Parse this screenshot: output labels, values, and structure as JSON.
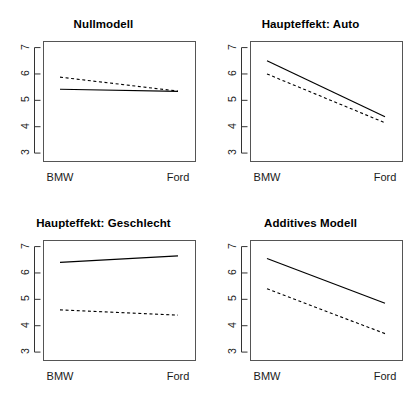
{
  "figure": {
    "type": "multi-panel-interaction-plot",
    "rows": 2,
    "cols": 2,
    "background": "#ffffff",
    "line_color": "#000000"
  },
  "chart_data": [
    {
      "type": "line",
      "title": "Nullmodell",
      "panel": "top-left",
      "categories": [
        "BMW",
        "Ford"
      ],
      "x": [
        1,
        2
      ],
      "xlabel": "",
      "ylabel": "",
      "ylim": [
        2.7,
        7.25
      ],
      "yticks": [
        3,
        4,
        5,
        6,
        7
      ],
      "ytick_labels": [
        "3",
        "4",
        "5",
        "6",
        "7"
      ],
      "grid": false,
      "legend": "none",
      "series": [
        {
          "name": "solid",
          "style": "solid",
          "values": [
            5.42,
            5.34
          ]
        },
        {
          "name": "dashed",
          "style": "dashed",
          "values": [
            5.88,
            5.35
          ]
        }
      ]
    },
    {
      "type": "line",
      "title": "Haupteffekt: Auto",
      "panel": "top-right",
      "categories": [
        "BMW",
        "Ford"
      ],
      "x": [
        1,
        2
      ],
      "xlabel": "",
      "ylabel": "",
      "ylim": [
        2.7,
        7.25
      ],
      "yticks": [
        3,
        4,
        5,
        6,
        7
      ],
      "ytick_labels": [
        "3",
        "4",
        "5",
        "6",
        "7"
      ],
      "grid": false,
      "legend": "none",
      "series": [
        {
          "name": "solid",
          "style": "solid",
          "values": [
            6.5,
            4.38
          ]
        },
        {
          "name": "dashed",
          "style": "dashed",
          "values": [
            6.0,
            4.15
          ]
        }
      ]
    },
    {
      "type": "line",
      "title": "Haupteffekt: Geschlecht",
      "panel": "bottom-left",
      "categories": [
        "BMW",
        "Ford"
      ],
      "x": [
        1,
        2
      ],
      "xlabel": "",
      "ylabel": "",
      "ylim": [
        2.7,
        7.25
      ],
      "yticks": [
        3,
        4,
        5,
        6,
        7
      ],
      "ytick_labels": [
        "3",
        "4",
        "5",
        "6",
        "7"
      ],
      "grid": false,
      "legend": "none",
      "series": [
        {
          "name": "solid",
          "style": "solid",
          "values": [
            6.4,
            6.65
          ]
        },
        {
          "name": "dashed",
          "style": "dashed",
          "values": [
            4.6,
            4.4
          ]
        }
      ]
    },
    {
      "type": "line",
      "title": "Additives Modell",
      "panel": "bottom-right",
      "categories": [
        "BMW",
        "Ford"
      ],
      "x": [
        1,
        2
      ],
      "xlabel": "",
      "ylabel": "",
      "ylim": [
        2.7,
        7.25
      ],
      "yticks": [
        3,
        4,
        5,
        6,
        7
      ],
      "ytick_labels": [
        "3",
        "4",
        "5",
        "6",
        "7"
      ],
      "grid": false,
      "legend": "none",
      "series": [
        {
          "name": "solid",
          "style": "solid",
          "values": [
            6.55,
            4.85
          ]
        },
        {
          "name": "dashed",
          "style": "dashed",
          "values": [
            5.4,
            3.7
          ]
        }
      ]
    }
  ]
}
